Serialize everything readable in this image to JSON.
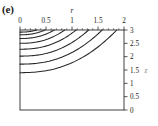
{
  "panel": {
    "label": "(e)"
  },
  "chart_data": {
    "type": "line",
    "title": "(e)",
    "xlabel": "r",
    "ylabel": "z",
    "xlim": [
      0,
      2
    ],
    "ylim": [
      0,
      3
    ],
    "x_axis_position": "top",
    "y_axis_position": "right",
    "grid": false,
    "legend": "none",
    "x_ticks": [
      0,
      0.5,
      1,
      1.5,
      2
    ],
    "x_tick_labels": [
      "0",
      "0.5",
      "1",
      "1.5",
      "2"
    ],
    "x_minor_tick_count": 4,
    "y_ticks": [
      0,
      0.5,
      1,
      1.5,
      2,
      2.5,
      3
    ],
    "y_tick_labels_top_to_bottom": [
      "3",
      "2.5",
      "2",
      "1.5",
      "1",
      "0.5",
      "0"
    ],
    "y_minor_tick_count": 0,
    "series": [
      {
        "name": "contour-1",
        "z_at_r0": 2.92,
        "r_at_ztop": 0.32,
        "points": [
          [
            0,
            2.92
          ],
          [
            0.08,
            2.94
          ],
          [
            0.16,
            2.96
          ],
          [
            0.24,
            2.98
          ],
          [
            0.32,
            3.0
          ]
        ]
      },
      {
        "name": "contour-2",
        "z_at_r0": 2.82,
        "r_at_ztop": 0.48,
        "points": [
          [
            0,
            2.82
          ],
          [
            0.12,
            2.86
          ],
          [
            0.24,
            2.91
          ],
          [
            0.36,
            2.96
          ],
          [
            0.48,
            3.0
          ]
        ]
      },
      {
        "name": "contour-3",
        "z_at_r0": 2.68,
        "r_at_ztop": 0.66,
        "points": [
          [
            0,
            2.68
          ],
          [
            0.17,
            2.75
          ],
          [
            0.33,
            2.84
          ],
          [
            0.5,
            2.93
          ],
          [
            0.66,
            3.0
          ]
        ]
      },
      {
        "name": "contour-4",
        "z_at_r0": 2.5,
        "r_at_ztop": 0.86,
        "points": [
          [
            0,
            2.5
          ],
          [
            0.22,
            2.6
          ],
          [
            0.43,
            2.74
          ],
          [
            0.65,
            2.89
          ],
          [
            0.86,
            3.0
          ]
        ]
      },
      {
        "name": "contour-5",
        "z_at_r0": 2.28,
        "r_at_ztop": 1.08,
        "points": [
          [
            0,
            2.28
          ],
          [
            0.27,
            2.4
          ],
          [
            0.54,
            2.58
          ],
          [
            0.81,
            2.82
          ],
          [
            1.08,
            3.0
          ]
        ]
      },
      {
        "name": "contour-6",
        "z_at_r0": 2.02,
        "r_at_ztop": 1.32,
        "points": [
          [
            0,
            2.02
          ],
          [
            0.33,
            2.15
          ],
          [
            0.66,
            2.38
          ],
          [
            0.99,
            2.7
          ],
          [
            1.32,
            3.0
          ]
        ]
      },
      {
        "name": "contour-7",
        "z_at_r0": 1.72,
        "r_at_ztop": 1.58,
        "points": [
          [
            0,
            1.72
          ],
          [
            0.4,
            1.85
          ],
          [
            0.79,
            2.12
          ],
          [
            1.19,
            2.52
          ],
          [
            1.58,
            3.0
          ]
        ]
      },
      {
        "name": "contour-8",
        "z_at_r0": 1.4,
        "r_at_ztop": 1.86,
        "points": [
          [
            0,
            1.4
          ],
          [
            0.47,
            1.52
          ],
          [
            0.93,
            1.8
          ],
          [
            1.4,
            2.3
          ],
          [
            1.86,
            3.0
          ]
        ]
      }
    ]
  }
}
